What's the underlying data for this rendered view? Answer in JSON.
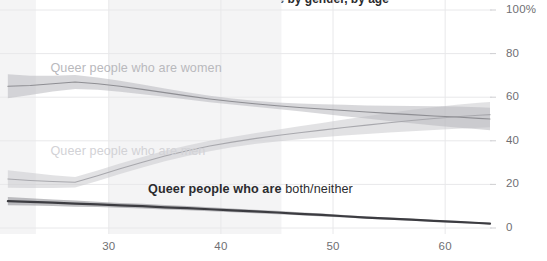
{
  "chart_data": {
    "type": "line",
    "title": "Share of queer people by gender, by age",
    "subtitle": "",
    "xlabel": "",
    "ylabel": "",
    "xlim": [
      20.3,
      64.0
    ],
    "ylim": [
      0,
      100
    ],
    "xticks": [
      30,
      40,
      50,
      60
    ],
    "xticklabels": [
      "30",
      "40",
      "50",
      "60"
    ],
    "yticks": [
      0,
      20,
      40,
      60,
      80,
      100
    ],
    "yticklabels": [
      "0",
      "20",
      "40",
      "60",
      "80",
      "100%"
    ],
    "grid": true,
    "legend_position": "inline-labels",
    "bands": "95% confidence intervals shaded around each line",
    "shaded_x_regions": [
      {
        "from": 20.3,
        "to": 23.5
      },
      {
        "from": 30.0,
        "to": 45.4
      }
    ],
    "x": [
      21,
      23,
      25,
      27,
      29,
      31,
      33,
      35,
      37,
      39,
      41,
      43,
      45,
      47,
      49,
      51,
      53,
      55,
      57,
      59,
      61,
      63,
      64
    ],
    "series": [
      {
        "name": "Queer people who are women",
        "color": "#8e8e93",
        "band_color": "#b8b8bd",
        "values": [
          65.0,
          65.4,
          66.2,
          67.0,
          66.2,
          65.0,
          63.6,
          62.1,
          60.6,
          59.2,
          58.0,
          57.0,
          56.1,
          55.3,
          54.6,
          53.9,
          53.2,
          52.6,
          52.0,
          51.4,
          50.9,
          50.3,
          50.0
        ],
        "band_low": [
          59.5,
          61.0,
          62.6,
          63.8,
          63.4,
          62.5,
          61.4,
          60.2,
          58.9,
          57.7,
          56.6,
          55.6,
          54.6,
          53.5,
          52.4,
          51.3,
          50.2,
          49.1,
          48.0,
          47.0,
          46.1,
          45.3,
          44.8
        ],
        "band_high": [
          70.5,
          69.8,
          69.8,
          70.2,
          69.0,
          67.5,
          65.8,
          64.0,
          62.3,
          60.7,
          59.4,
          58.4,
          57.6,
          57.1,
          56.8,
          56.5,
          56.2,
          56.1,
          56.0,
          55.8,
          55.7,
          55.4,
          55.2
        ]
      },
      {
        "name": "Queer people who are men",
        "color": "#a8a8ad",
        "band_color": "#cacace",
        "values": [
          22.5,
          21.8,
          21.3,
          21.0,
          24.0,
          27.2,
          30.2,
          33.0,
          35.4,
          37.6,
          39.4,
          41.0,
          42.4,
          43.7,
          44.9,
          46.1,
          47.2,
          48.3,
          49.3,
          50.2,
          51.0,
          51.7,
          52.0
        ],
        "band_low": [
          18.5,
          18.3,
          18.4,
          18.6,
          21.6,
          24.8,
          27.8,
          30.6,
          33.0,
          35.2,
          37.0,
          38.5,
          39.7,
          40.7,
          41.6,
          42.4,
          43.1,
          43.8,
          44.4,
          45.0,
          45.5,
          46.0,
          46.2
        ],
        "band_high": [
          26.5,
          25.3,
          24.2,
          23.4,
          26.4,
          29.6,
          32.6,
          35.4,
          37.8,
          40.0,
          41.8,
          43.5,
          45.1,
          46.7,
          48.2,
          49.8,
          51.3,
          52.8,
          54.2,
          55.4,
          56.5,
          57.4,
          57.8
        ]
      },
      {
        "name": "Queer people who are both/neither",
        "color": "#3c3c41",
        "band_color": "#8a8a90",
        "values": [
          12.3,
          12.0,
          11.6,
          11.2,
          10.8,
          10.4,
          10.0,
          9.5,
          9.1,
          8.6,
          8.1,
          7.6,
          7.1,
          6.5,
          6.0,
          5.4,
          4.8,
          4.3,
          3.8,
          3.3,
          2.8,
          2.3,
          2.0
        ],
        "band_low": [
          10.4,
          10.3,
          10.1,
          9.8,
          9.6,
          9.3,
          8.9,
          8.5,
          8.1,
          7.7,
          7.2,
          6.8,
          6.3,
          5.8,
          5.3,
          4.8,
          4.3,
          3.8,
          3.3,
          2.9,
          2.4,
          2.0,
          1.7
        ],
        "band_high": [
          14.2,
          13.7,
          13.1,
          12.6,
          12.0,
          11.5,
          11.1,
          10.5,
          10.1,
          9.5,
          9.0,
          8.4,
          7.9,
          7.2,
          6.7,
          6.0,
          5.3,
          4.8,
          4.3,
          3.7,
          3.2,
          2.6,
          2.3
        ]
      }
    ],
    "annotations": [
      {
        "text": "Queer people who are women",
        "x": 24.8,
        "y": 73.0,
        "style": "light-gray"
      },
      {
        "text": "Queer people who are men",
        "x": 24.8,
        "y": 35.0,
        "style": "lighter-gray"
      },
      {
        "text": "Queer people who are both/neither",
        "x": 33.5,
        "y": 17.5,
        "style": "dark-bold"
      }
    ]
  },
  "labels": {
    "women": "Queer people who are women",
    "men": "Queer people who are men",
    "both_bold": "Queer people who are ",
    "both_regular": "both/neither"
  },
  "colors": {
    "women_line": "#8e8e93",
    "men_line": "#a8a8ad",
    "both_line": "#3c3c41",
    "grid": "#e8e8ea",
    "tick_text": "#6f6f73",
    "shade": "#f4f4f5"
  }
}
